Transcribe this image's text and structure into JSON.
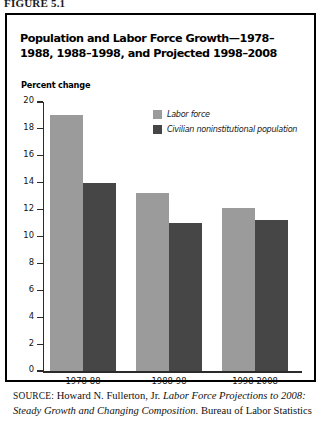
{
  "figure": {
    "caption": "FIGURE 5.1"
  },
  "chart_title": "Population and Labor Force Growth—1978–1988, 1988–1998, and Projected 1998–2008",
  "axis": {
    "ylabel": "Percent change"
  },
  "legend": {
    "items": [
      {
        "label": "Labor force",
        "color": "#9b9b9b",
        "swatch": "light"
      },
      {
        "label": "Civilian noninstitutional population",
        "color": "#464646",
        "swatch": "dark"
      }
    ]
  },
  "source": {
    "label": "SOURCE:",
    "author": "Howard N. Fullerton, Jr.",
    "title_italic": "Labor Force Projections to 2008: Steady Growth and Changing Composition.",
    "publisher": "Bureau of Labor Statistics"
  },
  "chart_data": {
    "type": "bar",
    "title": "Population and Labor Force Growth—1978–1988, 1988–1998, and Projected 1998–2008",
    "xlabel": "",
    "ylabel": "Percent change",
    "ylim": [
      0,
      20
    ],
    "yticks": [
      0,
      2,
      4,
      6,
      8,
      10,
      12,
      14,
      16,
      18,
      20
    ],
    "ytick_labels": [
      "0",
      "2",
      "4",
      "6",
      "8",
      "10",
      "12",
      "14",
      "16",
      "18",
      "20"
    ],
    "grid": false,
    "legend_position": "upper-right",
    "categories": [
      "1978-88",
      "1988-98",
      "1998-2008"
    ],
    "series": [
      {
        "name": "Labor force",
        "color": "#9b9b9b",
        "values": [
          19.0,
          13.2,
          12.1
        ]
      },
      {
        "name": "Civilian noninstitutional population",
        "color": "#464646",
        "values": [
          14.0,
          11.0,
          11.2
        ]
      }
    ]
  }
}
